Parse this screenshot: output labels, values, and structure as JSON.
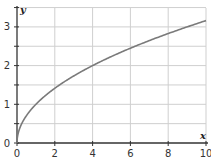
{
  "chart_data": {
    "type": "line",
    "title": "",
    "xlabel": "x",
    "ylabel": "y",
    "xlim": [
      0,
      10
    ],
    "ylim": [
      0,
      3.5
    ],
    "grid": true,
    "x_ticks": [
      "0",
      "2",
      "4",
      "6",
      "8",
      "10"
    ],
    "y_ticks": [
      "0",
      "1",
      "2",
      "3"
    ],
    "series": [
      {
        "name": "y = sqrt(x)",
        "x": [
          0,
          0.25,
          0.5,
          1,
          1.5,
          2,
          3,
          4,
          5,
          6,
          7,
          8,
          9,
          10
        ],
        "y": [
          0,
          0.5,
          0.71,
          1.0,
          1.22,
          1.41,
          1.73,
          2.0,
          2.24,
          2.45,
          2.65,
          2.83,
          3.0,
          3.16
        ]
      }
    ],
    "colors": {
      "curve": "#7a7a7a",
      "grid": "#cfcfcf",
      "axis": "#333333"
    }
  }
}
